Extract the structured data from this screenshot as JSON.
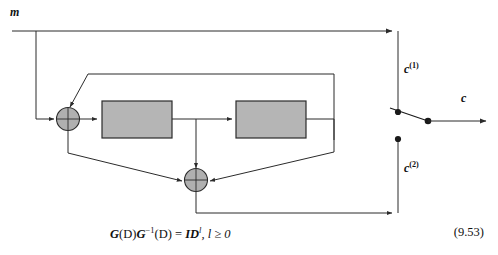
{
  "figure": {
    "type": "block-diagram",
    "input_label": {
      "text": "m",
      "style": "bold-italic"
    },
    "outputs": [
      {
        "id": "c1",
        "base": "c",
        "superscript": "(1)"
      },
      {
        "id": "c2",
        "base": "c",
        "superscript": "(2)"
      }
    ],
    "final_output_label": {
      "base": "c",
      "superscript": ""
    },
    "blocks": [
      {
        "id": "delay-block-1",
        "label": "",
        "fill": "#b5b5b5",
        "stroke": "#2b2b2b"
      },
      {
        "id": "delay-block-2",
        "label": "",
        "fill": "#b5b5b5",
        "stroke": "#2b2b2b"
      }
    ],
    "adders": [
      {
        "id": "adder-1",
        "symbol": "+",
        "fill": "#b0b0b0"
      },
      {
        "id": "adder-2",
        "symbol": "+",
        "fill": "#b0b0b0"
      }
    ],
    "switch": {
      "id": "output-commutator",
      "position": "upper",
      "contacts": 2
    },
    "colors": {
      "wire": "#2b2b2b",
      "block_fill": "#b5b5b5",
      "adder_fill": "#b0b0b0",
      "dot": "#1a1a1a",
      "background": "#ffffff"
    }
  },
  "equation": {
    "lhs_g": "G",
    "lhs_d1": "(D)",
    "lhs_ginv": "G",
    "lhs_ginv_sup": "−1",
    "lhs_d2": "(D)",
    "equals": "=",
    "rhs_id": "ID",
    "rhs_sup": "l",
    "rhs_tail": ", l ≥ 0",
    "full_text": "G(D)G⁻¹(D) = IDˡ, l ≥ 0",
    "number": "(9.53)"
  }
}
